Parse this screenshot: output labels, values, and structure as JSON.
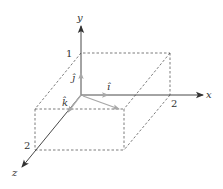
{
  "diagram": {
    "type": "3d-coordinate-axes-with-box",
    "axes": {
      "x": {
        "label": "x",
        "tick_label": "2"
      },
      "y": {
        "label": "y",
        "tick_label": "1"
      },
      "z": {
        "label": "z",
        "tick_label": "2"
      }
    },
    "unit_vectors": {
      "i": {
        "label": "î"
      },
      "j": {
        "label": "ĵ"
      },
      "k": {
        "label": "k̂"
      }
    },
    "box": {
      "dimensions": "2 × 1 × 2",
      "style": "dashed"
    },
    "colors": {
      "axis": "#333333",
      "unit_vector": "#a8a8a8",
      "box_edges": "#444444",
      "text": "#333333"
    }
  }
}
